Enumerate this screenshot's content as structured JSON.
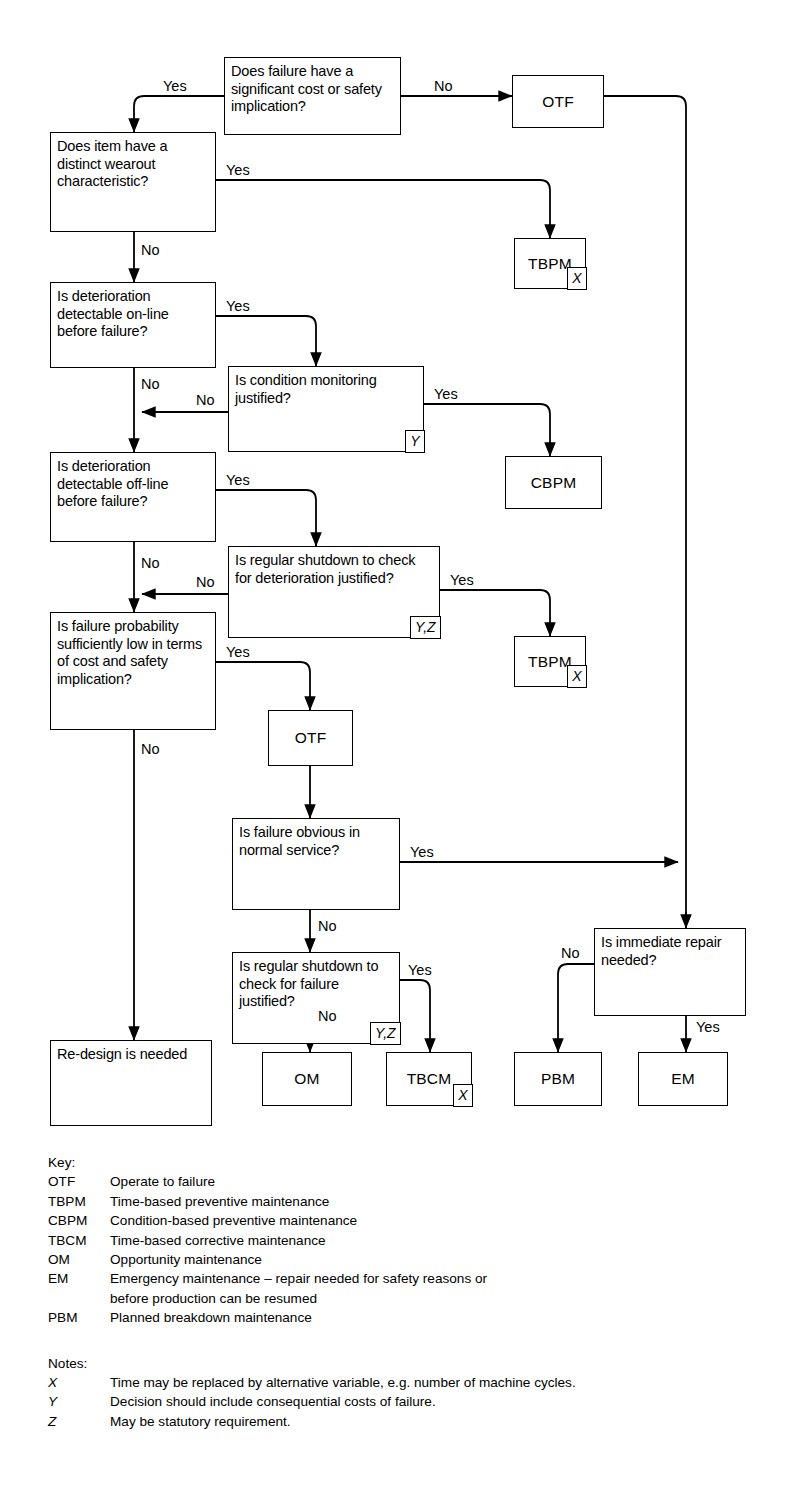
{
  "diagram": {
    "nodes": {
      "q_failure_significant": "Does failure have a significant cost or safety implication?",
      "otf_top": "OTF",
      "q_wearout": "Does item have a distinct wearout characteristic?",
      "tbpm_top": "TBPM",
      "tbpm_top_marker": "X",
      "q_det_online": "Is deterioration detectable on-line before failure?",
      "q_cond_monitoring": "Is condition monitoring justified?",
      "q_cond_monitoring_marker": "Y",
      "cbpm": "CBPM",
      "q_det_offline": "Is deterioration detectable off-line before failure?",
      "q_shutdown_deterioration": "Is regular shutdown to check for deterioration justified?",
      "q_shutdown_deterioration_marker": "Y,Z",
      "tbpm_mid": "TBPM",
      "tbpm_mid_marker": "X",
      "q_failure_prob": "Is failure probability sufficiently low in terms of cost and safety implication?",
      "otf_mid": "OTF",
      "q_failure_obvious": "Is failure obvious in normal service?",
      "q_shutdown_failure": "Is regular shutdown to check for failure justified?",
      "q_shutdown_failure_marker": "Y,Z",
      "q_immediate_repair": "Is immediate repair needed?",
      "redesign": "Re-design is needed",
      "om": "OM",
      "tbcm": "TBCM",
      "tbcm_marker": "X",
      "pbm": "PBM",
      "em": "EM"
    },
    "edge_labels": {
      "yes": "Yes",
      "no": "No"
    },
    "edges": [
      {
        "from": "q_failure_significant",
        "to": "q_wearout",
        "label": "Yes"
      },
      {
        "from": "q_failure_significant",
        "to": "otf_top",
        "label": "No"
      },
      {
        "from": "q_wearout",
        "to": "tbpm_top",
        "label": "Yes"
      },
      {
        "from": "q_wearout",
        "to": "q_det_online",
        "label": "No"
      },
      {
        "from": "q_det_online",
        "to": "q_cond_monitoring",
        "label": "Yes"
      },
      {
        "from": "q_det_online",
        "to": "q_det_offline",
        "label": "No"
      },
      {
        "from": "q_cond_monitoring",
        "to": "cbpm",
        "label": "Yes"
      },
      {
        "from": "q_cond_monitoring",
        "to": "q_det_offline",
        "label": "No"
      },
      {
        "from": "q_det_offline",
        "to": "q_shutdown_deterioration",
        "label": "Yes"
      },
      {
        "from": "q_det_offline",
        "to": "q_failure_prob",
        "label": "No"
      },
      {
        "from": "q_shutdown_deterioration",
        "to": "tbpm_mid",
        "label": "Yes"
      },
      {
        "from": "q_shutdown_deterioration",
        "to": "q_failure_prob",
        "label": "No"
      },
      {
        "from": "q_failure_prob",
        "to": "otf_mid",
        "label": "Yes"
      },
      {
        "from": "q_failure_prob",
        "to": "redesign",
        "label": "No"
      },
      {
        "from": "otf_mid",
        "to": "q_failure_obvious",
        "label": ""
      },
      {
        "from": "q_failure_obvious",
        "to": "q_immediate_repair",
        "label": "Yes"
      },
      {
        "from": "q_failure_obvious",
        "to": "q_shutdown_failure",
        "label": "No"
      },
      {
        "from": "q_shutdown_failure",
        "to": "tbcm",
        "label": "Yes"
      },
      {
        "from": "q_shutdown_failure",
        "to": "om",
        "label": "No"
      },
      {
        "from": "otf_top",
        "to": "q_immediate_repair",
        "label": ""
      },
      {
        "from": "q_immediate_repair",
        "to": "pbm",
        "label": "No"
      },
      {
        "from": "q_immediate_repair",
        "to": "em",
        "label": "Yes"
      }
    ]
  },
  "key": {
    "heading": "Key:",
    "items": [
      {
        "abbr": "OTF",
        "text": "Operate to failure"
      },
      {
        "abbr": "TBPM",
        "text": "Time-based preventive maintenance"
      },
      {
        "abbr": "CBPM",
        "text": "Condition-based preventive maintenance"
      },
      {
        "abbr": "TBCM",
        "text": "Time-based corrective maintenance"
      },
      {
        "abbr": "OM",
        "text": "Opportunity maintenance"
      },
      {
        "abbr": "EM",
        "text": "Emergency maintenance – repair needed for safety reasons or",
        "cont": "before production can be resumed"
      },
      {
        "abbr": "PBM",
        "text": "Planned breakdown maintenance"
      }
    ]
  },
  "notes": {
    "heading": "Notes:",
    "items": [
      {
        "abbr": "X",
        "text": "Time may be replaced by alternative variable, e.g. number of machine cycles."
      },
      {
        "abbr": "Y",
        "text": "Decision should include consequential costs of failure."
      },
      {
        "abbr": "Z",
        "text": "May be statutory requirement."
      }
    ]
  },
  "colors": {
    "line": "#000000",
    "background": "#ffffff",
    "text": "#000000"
  }
}
